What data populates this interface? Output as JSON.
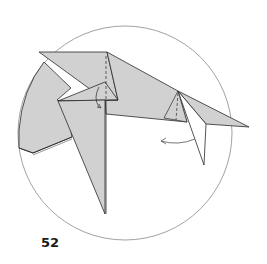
{
  "step": {
    "number": "52"
  },
  "diagram": {
    "colors": {
      "paper": "#d1d1d1",
      "line": "#2a2a2a",
      "circle": "#7a7a7a",
      "background": "#ffffff"
    },
    "arrows": [
      {
        "name": "small-curl-arrow",
        "direction": "down-right"
      },
      {
        "name": "fold-left-arrow",
        "direction": "left"
      }
    ],
    "fold_lines": [
      {
        "name": "valley-fold-center",
        "style": "dashed"
      },
      {
        "name": "valley-fold-right",
        "style": "dashed"
      }
    ]
  }
}
